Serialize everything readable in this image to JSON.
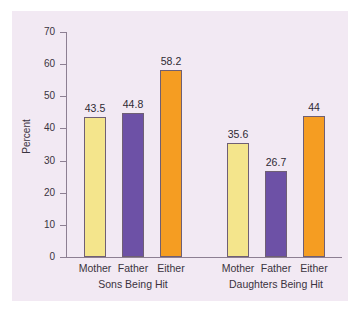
{
  "chart_data": {
    "type": "bar",
    "title": "",
    "xlabel": "",
    "ylabel": "Percent",
    "ylim": [
      0,
      70
    ],
    "ytick_labels": [
      "70",
      "60",
      "50",
      "40",
      "30",
      "20",
      "10",
      "0"
    ],
    "ytick_values": [
      70,
      60,
      50,
      40,
      30,
      20,
      10,
      0
    ],
    "grid": false,
    "legend": "none",
    "categories": [
      "Mother",
      "Father",
      "Either"
    ],
    "groups": [
      {
        "name": "Sons Being Hit",
        "bars": [
          {
            "category": "Mother",
            "value": 43.5,
            "label": "43.5",
            "color": "#f4e58c"
          },
          {
            "category": "Father",
            "value": 44.8,
            "label": "44.8",
            "color": "#6d51a6"
          },
          {
            "category": "Either",
            "value": 58.2,
            "label": "58.2",
            "color": "#f59d22"
          }
        ]
      },
      {
        "name": "Daughters Being Hit",
        "bars": [
          {
            "category": "Mother",
            "value": 35.6,
            "label": "35.6",
            "color": "#f4e58c"
          },
          {
            "category": "Father",
            "value": 26.7,
            "label": "26.7",
            "color": "#6d51a6"
          },
          {
            "category": "Either",
            "value": 44.0,
            "label": "44",
            "color": "#f59d22"
          }
        ]
      }
    ],
    "colors": {
      "mother": "#f4e58c",
      "father": "#6d51a6",
      "either": "#f59d22",
      "panel_background": "#f2e9f3",
      "axis": "#8d7f92",
      "text": "#3a3340",
      "bar_outline": "#6f5f74"
    }
  }
}
